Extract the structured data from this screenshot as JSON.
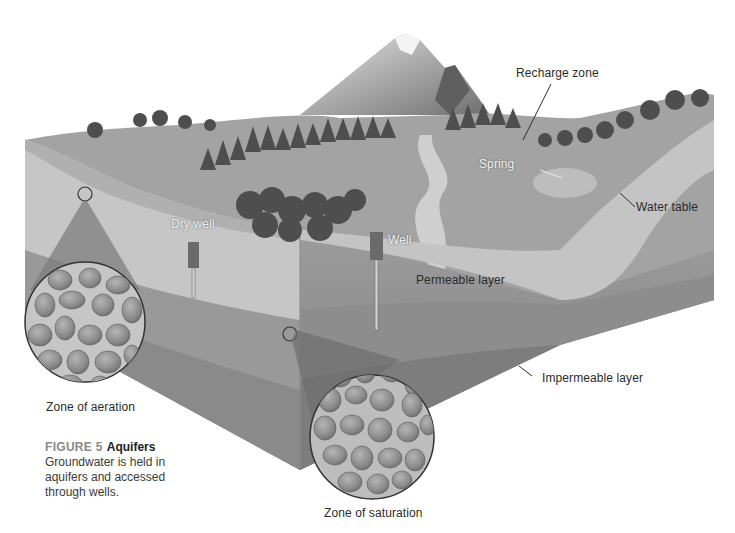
{
  "figure": {
    "number_label": "FIGURE 5",
    "title": "Aquifers",
    "caption": "Groundwater is held in aquifers and accessed through wells."
  },
  "labels": {
    "recharge_zone": "Recharge zone",
    "spring": "Spring",
    "water_table": "Water table",
    "dry_well": "Dry well",
    "well": "Well",
    "permeable_layer": "Permeable layer",
    "impermeable_layer": "Impermeable layer",
    "zone_of_aeration": "Zone of aeration",
    "zone_of_saturation": "Zone of saturation"
  },
  "colors": {
    "background": "#ffffff",
    "surface": "#9a9a9a",
    "permeable": "#c4c4c4",
    "impermeable": "#8c8c8c",
    "deep": "#7a7a7a",
    "grain": "#8f8f8f",
    "label_text": "#2b2b2b"
  }
}
